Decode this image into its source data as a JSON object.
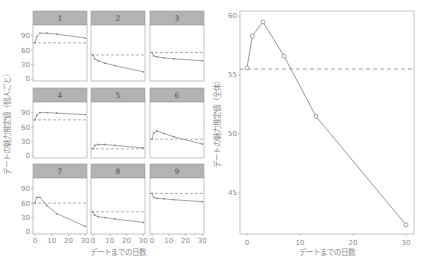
{
  "chart_data": [
    {
      "type": "line",
      "title": "",
      "layout": "facet-grid 3x3",
      "xlabel": "デートまでの日数",
      "ylabel": "デートの魅力推定値（個人ごと）",
      "x": [
        0,
        1,
        3,
        7,
        13,
        30
      ],
      "xlim": [
        0,
        30
      ],
      "ylim": [
        0,
        100
      ],
      "xticks": [
        0,
        10,
        20,
        30
      ],
      "yticks": [
        0,
        30,
        60,
        90
      ],
      "grid": false,
      "reference_line": "dashed horizontal at day-0 value",
      "panels": [
        {
          "label": "1",
          "values": [
            75,
            88,
            95,
            95,
            93,
            85
          ],
          "baseline": 75
        },
        {
          "label": "2",
          "values": [
            50,
            42,
            38,
            33,
            28,
            15
          ],
          "baseline": 50
        },
        {
          "label": "3",
          "values": [
            55,
            48,
            46,
            44,
            42,
            38
          ],
          "baseline": 55
        },
        {
          "label": "4",
          "values": [
            75,
            85,
            90,
            90,
            89,
            86
          ],
          "baseline": 75
        },
        {
          "label": "5",
          "values": [
            15,
            22,
            24,
            24,
            22,
            17
          ],
          "baseline": 15
        },
        {
          "label": "6",
          "values": [
            35,
            48,
            52,
            47,
            40,
            25
          ],
          "baseline": 35
        },
        {
          "label": "7",
          "values": [
            60,
            72,
            72,
            55,
            38,
            12
          ],
          "baseline": 60
        },
        {
          "label": "8",
          "values": [
            42,
            35,
            32,
            30,
            27,
            20
          ],
          "baseline": 42
        },
        {
          "label": "9",
          "values": [
            80,
            72,
            70,
            69,
            67,
            63
          ],
          "baseline": 80
        }
      ]
    },
    {
      "type": "line",
      "title": "",
      "xlabel": "デートまでの日数",
      "ylabel": "デートの魅力推定値（全体）",
      "x": [
        0,
        1,
        3,
        7,
        13,
        30
      ],
      "values": [
        55.6,
        58.3,
        59.5,
        56.6,
        51.5,
        42.3
      ],
      "xlim": [
        -1.2,
        31
      ],
      "ylim": [
        41.5,
        60.5
      ],
      "xticks": [
        0,
        10,
        20,
        30
      ],
      "yticks": [
        45,
        50,
        55,
        60
      ],
      "baseline": 55.5,
      "reference_line": "dashed horizontal at 55.5",
      "markers": "open circles",
      "grid": false
    }
  ],
  "colors": {
    "line": "#8c8c8c",
    "strip": "#b3b3b3",
    "frame": "#9a9a9a",
    "text": "#8a8a8a"
  }
}
